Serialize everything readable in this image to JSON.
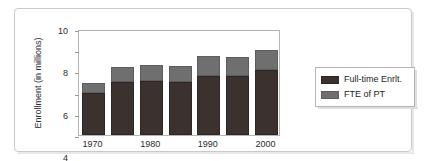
{
  "chart_data": {
    "type": "bar",
    "subtype": "stacked-vertical",
    "title": "",
    "xlabel": "",
    "ylabel": "Enrollment (in millions)",
    "ylim": [
      0,
      10
    ],
    "ytick_labels": [
      "0",
      "2",
      "4",
      "6",
      "8",
      "10"
    ],
    "ytick_values": [
      0,
      2,
      4,
      6,
      8,
      10
    ],
    "grid": false,
    "legend_position": "right",
    "categories": [
      "1970",
      "1975",
      "1980",
      "1985",
      "1990",
      "1995",
      "2000"
    ],
    "xtick_labels": [
      "1970",
      "1980",
      "1990",
      "2000"
    ],
    "xtick_categories": [
      "1970",
      "1980",
      "1990",
      "2000"
    ],
    "series": [
      {
        "name": "Full-time Enrlt.",
        "color": "#3b3230",
        "values": [
          4.0,
          5.0,
          5.1,
          5.0,
          5.55,
          5.55,
          6.1
        ]
      },
      {
        "name": "FTE of PT",
        "color": "#6f6f6f",
        "values": [
          0.9,
          1.4,
          1.5,
          1.55,
          1.9,
          1.85,
          1.95
        ]
      }
    ],
    "totals": [
      4.9,
      6.4,
      6.6,
      6.55,
      7.45,
      7.4,
      8.05
    ]
  },
  "legend": {
    "items": [
      {
        "label": "Full-time Enrlt."
      },
      {
        "label": "FTE of PT"
      }
    ]
  }
}
